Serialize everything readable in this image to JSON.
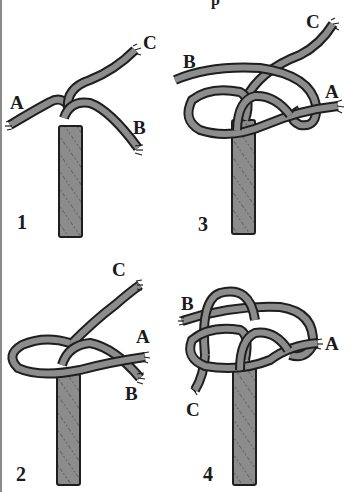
{
  "diagram": {
    "title_fragment": "p",
    "rope_color": "#8c8c8c",
    "outline_color": "#1e1e1e",
    "background": "#ffffff",
    "panels": [
      {
        "step": "1",
        "labels": {
          "A": "A",
          "B": "B",
          "C": "C"
        }
      },
      {
        "step": "2",
        "labels": {
          "A": "A",
          "B": "B",
          "C": "C"
        }
      },
      {
        "step": "3",
        "labels": {
          "A": "A",
          "B": "B",
          "C": "C"
        }
      },
      {
        "step": "4",
        "labels": {
          "A": "A",
          "B": "B",
          "C": "C"
        }
      }
    ]
  }
}
